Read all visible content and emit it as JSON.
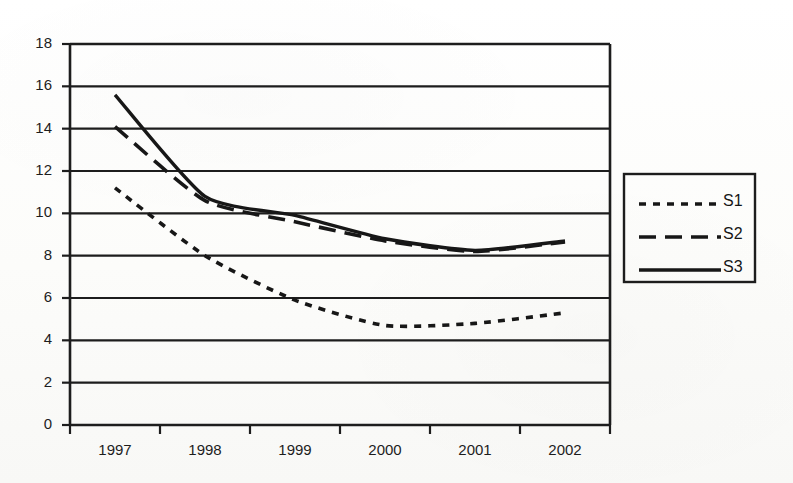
{
  "chart_data": {
    "type": "line",
    "title": "",
    "subtitle": "",
    "xlabel": "",
    "ylabel": "",
    "categories": [
      "1997",
      "1998",
      "1999",
      "2000",
      "2001",
      "2002"
    ],
    "x": [
      1997,
      1998,
      1999,
      2000,
      2001,
      2002
    ],
    "series": [
      {
        "name": "S1",
        "style": "dotted",
        "values": [
          11.2,
          8.0,
          5.9,
          4.7,
          4.8,
          5.3
        ]
      },
      {
        "name": "S2",
        "style": "dashed",
        "values": [
          14.1,
          10.6,
          9.6,
          8.7,
          8.2,
          8.65
        ]
      },
      {
        "name": "S3",
        "style": "solid",
        "values": [
          15.6,
          10.8,
          9.9,
          8.8,
          8.25,
          8.7
        ]
      }
    ],
    "ylim": [
      0,
      18
    ],
    "xlim": [
      "1997",
      "2002"
    ],
    "ytick_values": [
      0,
      2,
      4,
      6,
      8,
      10,
      12,
      14,
      16,
      18
    ],
    "ytick_labels": [
      "0",
      "2",
      "4",
      "6",
      "8",
      "10",
      "12",
      "14",
      "16",
      "18"
    ],
    "xtick_labels": [
      "1997",
      "1998",
      "1999",
      "2000",
      "2001",
      "2002"
    ],
    "grid": "horizontal",
    "legend_position": "right-outside",
    "legend_entries": [
      "S1",
      "S2",
      "S3"
    ],
    "line_color": "#1a1a1a",
    "axis_color": "#1a1a1a",
    "background_color": "#fdfdfc"
  },
  "legend": {
    "entries": [
      {
        "label": "S1",
        "style": "dotted"
      },
      {
        "label": "S2",
        "style": "dashed"
      },
      {
        "label": "S3",
        "style": "solid"
      }
    ]
  },
  "yaxis": {
    "labels": [
      "18",
      "16",
      "14",
      "12",
      "10",
      "8",
      "6",
      "4",
      "2",
      "0"
    ]
  },
  "xaxis": {
    "labels": [
      "1997",
      "1998",
      "1999",
      "2000",
      "2001",
      "2002"
    ]
  }
}
